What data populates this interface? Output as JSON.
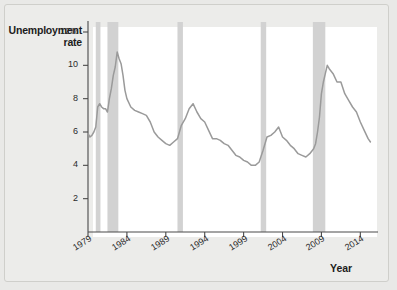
{
  "chart_data": {
    "type": "line",
    "title": "",
    "xlabel": "Year",
    "ylabel": "Unemployment rate",
    "xlim": [
      1979,
      2015.5
    ],
    "ylim": [
      0,
      12.6
    ],
    "grid": false,
    "legend": "none",
    "line_color": "#9a9a9a",
    "band_color": "#d2d2d2",
    "axis_color": "#4a4a4a",
    "y_ticks": [
      {
        "value": 12,
        "label": "12%"
      },
      {
        "value": 10,
        "label": "10"
      },
      {
        "value": 8,
        "label": "8"
      },
      {
        "value": 6,
        "label": "6"
      },
      {
        "value": 4,
        "label": "4"
      },
      {
        "value": 2,
        "label": "2"
      }
    ],
    "x_ticks": [
      {
        "value": 1979,
        "label": "1979"
      },
      {
        "value": 1984,
        "label": "1984"
      },
      {
        "value": 1989,
        "label": "1989"
      },
      {
        "value": 1994,
        "label": "1994"
      },
      {
        "value": 1999,
        "label": "1999"
      },
      {
        "value": 2004,
        "label": "2004"
      },
      {
        "value": 2009,
        "label": "2009"
      },
      {
        "value": 2014,
        "label": "2014"
      }
    ],
    "recession_bands": [
      {
        "start": 1980.0,
        "end": 1980.6
      },
      {
        "start": 1981.5,
        "end": 1982.9
      },
      {
        "start": 1990.5,
        "end": 1991.2
      },
      {
        "start": 2001.2,
        "end": 2001.9
      },
      {
        "start": 2007.9,
        "end": 2009.5
      }
    ],
    "series": [
      {
        "name": "Unemployment rate",
        "x": [
          1979.0,
          1979.25,
          1979.5,
          1979.75,
          1980.0,
          1980.25,
          1980.5,
          1980.75,
          1981.0,
          1981.25,
          1981.5,
          1981.75,
          1982.0,
          1982.25,
          1982.5,
          1982.75,
          1983.0,
          1983.25,
          1983.5,
          1983.75,
          1984.0,
          1984.5,
          1985.0,
          1985.5,
          1986.0,
          1986.5,
          1987.0,
          1987.5,
          1988.0,
          1988.5,
          1989.0,
          1989.5,
          1990.0,
          1990.5,
          1991.0,
          1991.5,
          1992.0,
          1992.5,
          1993.0,
          1993.5,
          1994.0,
          1994.5,
          1995.0,
          1995.5,
          1996.0,
          1996.5,
          1997.0,
          1997.5,
          1998.0,
          1998.5,
          1999.0,
          1999.5,
          2000.0,
          2000.5,
          2001.0,
          2001.5,
          2002.0,
          2002.5,
          2003.0,
          2003.5,
          2004.0,
          2004.5,
          2005.0,
          2005.5,
          2006.0,
          2006.5,
          2007.0,
          2007.5,
          2008.0,
          2008.25,
          2008.5,
          2008.75,
          2009.0,
          2009.25,
          2009.5,
          2009.75,
          2010.0,
          2010.5,
          2011.0,
          2011.5,
          2012.0,
          2012.5,
          2013.0,
          2013.5,
          2014.0,
          2014.5,
          2015.0,
          2015.3
        ],
        "y": [
          5.9,
          5.7,
          5.8,
          6.0,
          6.3,
          7.5,
          7.7,
          7.5,
          7.4,
          7.4,
          7.2,
          8.0,
          8.6,
          9.4,
          9.9,
          10.8,
          10.4,
          10.1,
          9.4,
          8.5,
          8.0,
          7.5,
          7.3,
          7.2,
          7.1,
          7.0,
          6.6,
          6.0,
          5.7,
          5.5,
          5.3,
          5.2,
          5.4,
          5.6,
          6.4,
          6.8,
          7.4,
          7.7,
          7.2,
          6.8,
          6.6,
          6.1,
          5.6,
          5.6,
          5.5,
          5.3,
          5.2,
          4.9,
          4.6,
          4.5,
          4.3,
          4.2,
          4.0,
          4.0,
          4.2,
          4.9,
          5.7,
          5.8,
          6.0,
          6.3,
          5.7,
          5.5,
          5.2,
          5.0,
          4.7,
          4.6,
          4.5,
          4.7,
          5.0,
          5.3,
          6.0,
          6.9,
          8.3,
          9.0,
          9.5,
          10.0,
          9.8,
          9.5,
          9.0,
          9.0,
          8.3,
          7.9,
          7.5,
          7.2,
          6.6,
          6.1,
          5.6,
          5.4
        ]
      }
    ]
  },
  "axis": {
    "y_title": "Unemployment\nrate",
    "y_title_line1": "Unemployment",
    "y_title_line2": "rate",
    "x_title": "Year"
  }
}
